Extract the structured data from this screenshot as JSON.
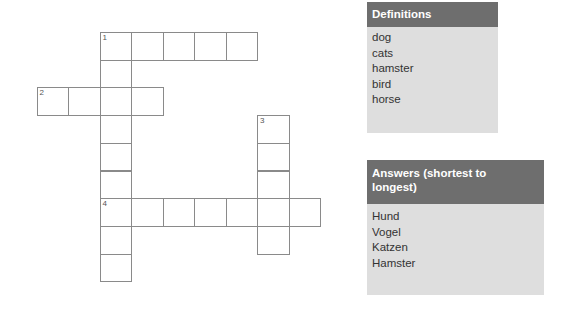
{
  "crossword": {
    "cell_width": 31.5,
    "cell_height": 27.7,
    "origin_x": 36.5,
    "origin_y": 32,
    "words": [
      {
        "number": "1",
        "direction": "across",
        "row": 0,
        "col": 2,
        "length": 5
      },
      {
        "number": "1",
        "direction": "down",
        "row": 0,
        "col": 2,
        "length": 9
      },
      {
        "number": "2",
        "direction": "across",
        "row": 2,
        "col": 0,
        "length": 4
      },
      {
        "number": "3",
        "direction": "down",
        "row": 3,
        "col": 7,
        "length": 5
      },
      {
        "number": "4",
        "direction": "across",
        "row": 6,
        "col": 2,
        "length": 7
      }
    ]
  },
  "definitions": {
    "title": "Definitions",
    "items": [
      "dog",
      "cats",
      "hamster",
      "bird",
      "horse"
    ]
  },
  "answers": {
    "title": "Answers (shortest to longest)",
    "items": [
      "Hund",
      "Vogel",
      "Katzen",
      "Hamster"
    ]
  }
}
